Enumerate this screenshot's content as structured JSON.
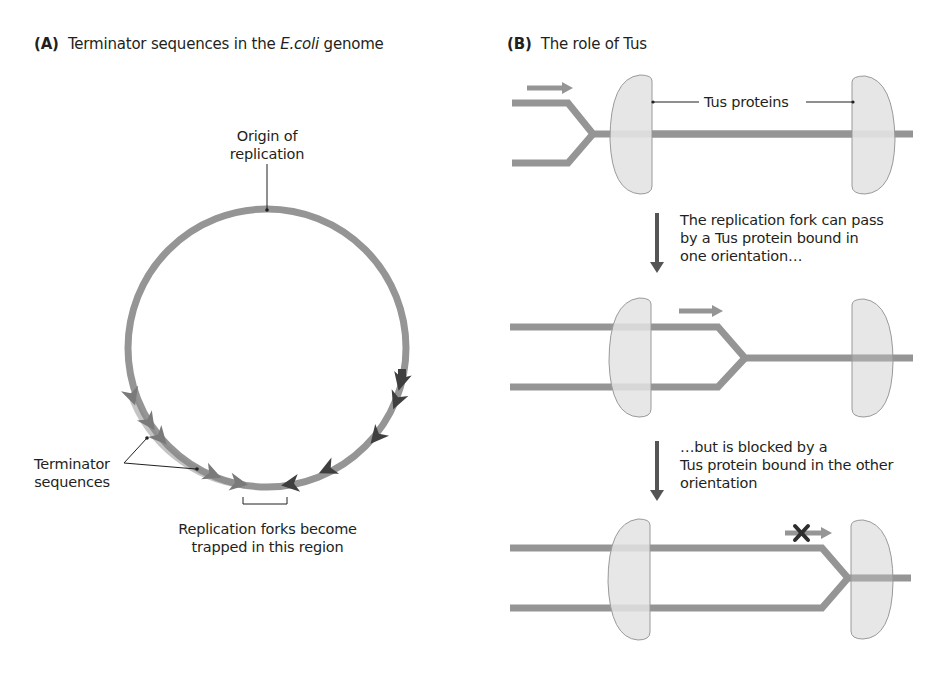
{
  "panel_a": {
    "letter": "(A)",
    "title_pre": "Terminator sequences in the ",
    "title_italic": "E.coli",
    "title_post": " genome",
    "origin_label_line1": "Origin of",
    "origin_label_line2": "replication",
    "terminator_label_line1": "Terminator",
    "terminator_label_line2": "sequences",
    "trap_label_line1": "Replication forks become",
    "trap_label_line2": "trapped in this region"
  },
  "panel_b": {
    "letter": "(B)",
    "title": "The role of Tus",
    "tus_label": "Tus proteins",
    "step1_line1": "The replication fork can pass",
    "step1_line2": "by a Tus protein bound in",
    "step1_line3": "one orientation…",
    "step2_line1": "…but is blocked by a",
    "step2_line2": "Tus protein bound in the other",
    "step2_line3": "orientation"
  },
  "colors": {
    "dna": "#959595",
    "tus_fill": "#e3e3e3",
    "tus_stroke": "#9a9a9a",
    "terminator_clockwise": "#7a7a7a",
    "terminator_counter": "#3f3f3f",
    "step_arrow": "#555555",
    "block_x": "#2e2e2e"
  }
}
